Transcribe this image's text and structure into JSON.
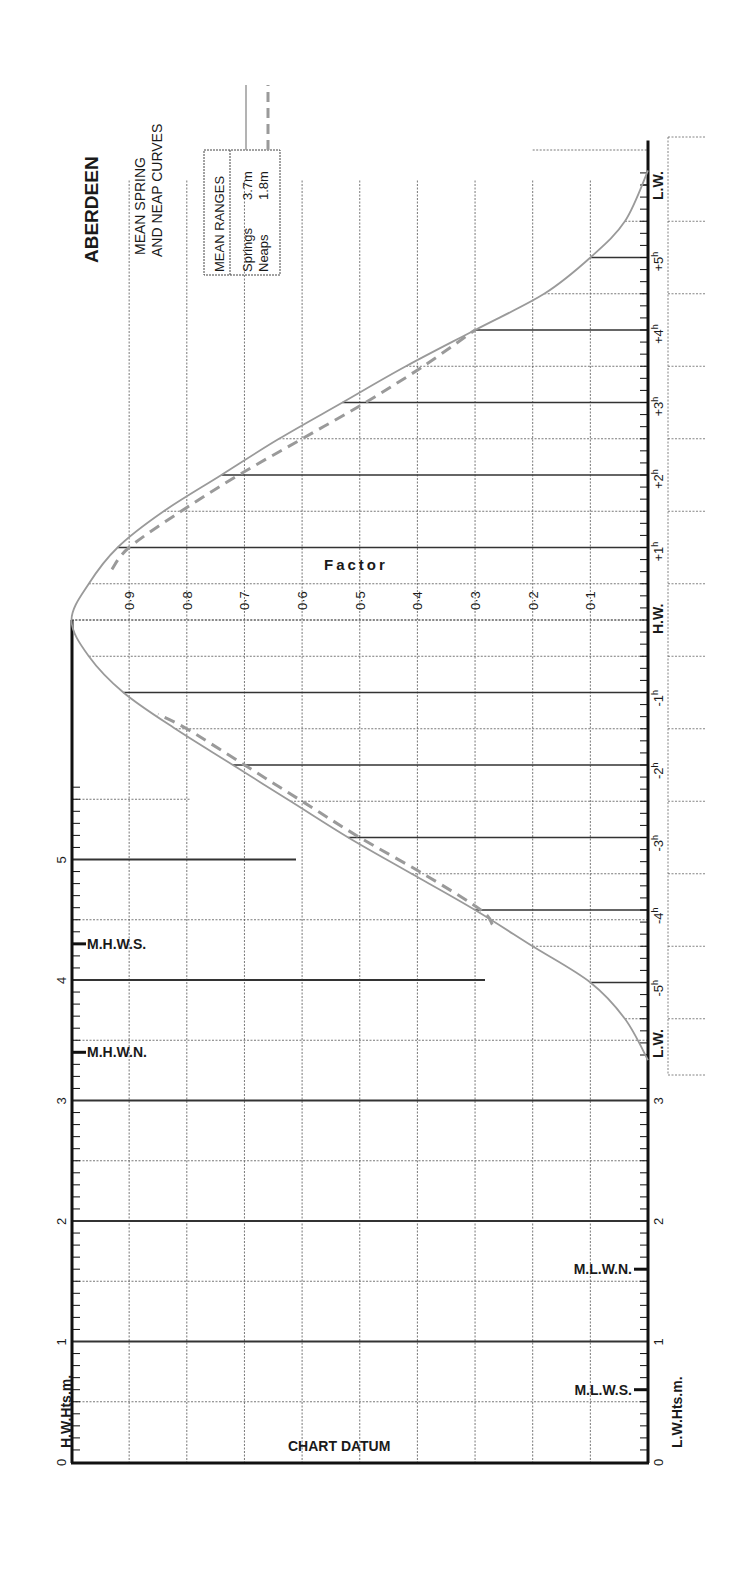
{
  "title": "ABERDEEN",
  "subtitle_lines": [
    "MEAN SPRING",
    "AND NEAP CURVES"
  ],
  "legend": {
    "header": "MEAN RANGES",
    "entries": [
      {
        "name": "Springs",
        "value": "3.7m",
        "style": "solid"
      },
      {
        "name": "Neaps",
        "value": "1.8m",
        "style": "dashed"
      }
    ]
  },
  "factor_axis_label": "Factor",
  "hw_axis_label": "H.W.Hts.m.",
  "lw_axis_label": "L.W.Hts.m.",
  "chart_datum_label": "CHART DATUM",
  "hw_markers": [
    {
      "label": "M.H.W.S.",
      "value": 4.3
    },
    {
      "label": "M.H.W.N.",
      "value": 3.4
    }
  ],
  "lw_markers": [
    {
      "label": "M.L.W.N.",
      "value": 1.6
    },
    {
      "label": "M.L.W.S.",
      "value": 0.6
    }
  ],
  "colors": {
    "axis": "#111111",
    "grid": "#555555",
    "curve": "#9a9a9a",
    "text": "#1a1a1a"
  },
  "chart_data": {
    "type": "line",
    "xlabel": "Time relative to H.W. (hours)",
    "ylabel": "Factor",
    "time_tick_labels": [
      "L.W.",
      "-5h",
      "-4h",
      "-3h",
      "-2h",
      "-1h",
      "H.W.",
      "+1h",
      "+2h",
      "+3h",
      "+4h",
      "+5h",
      "L.W."
    ],
    "time_ticks": [
      -6.07,
      -5,
      -4,
      -3,
      -2,
      -1,
      0,
      1,
      2,
      3,
      4,
      5,
      6.2
    ],
    "factor_ticks": [
      0.1,
      0.2,
      0.3,
      0.4,
      0.5,
      0.6,
      0.7,
      0.8,
      0.9
    ],
    "factor_tick_labels": [
      "0·1",
      "0·2",
      "0·3",
      "0·4",
      "0·5",
      "0·6",
      "0·7",
      "0·8",
      "0·9"
    ],
    "ylim": [
      0,
      1
    ],
    "hw_height_axis": {
      "label": "H.W.Hts.m.",
      "range": [
        0,
        5.7
      ],
      "ticks": [
        0,
        1,
        2,
        3,
        4,
        5
      ]
    },
    "lw_height_axis": {
      "label": "L.W.Hts.m.",
      "range": [
        0,
        3
      ],
      "ticks": [
        0,
        1,
        2,
        3
      ]
    },
    "series": [
      {
        "name": "Springs (3.7m)",
        "style": "solid",
        "x": [
          -6.07,
          -5.5,
          -5,
          -4.5,
          -4,
          -3.5,
          -3,
          -2.5,
          -2,
          -1.5,
          -1,
          -0.5,
          0,
          0.5,
          1,
          1.5,
          2,
          2.5,
          3,
          3.5,
          4,
          4.5,
          5,
          5.5,
          6.2
        ],
        "values": [
          0,
          0.04,
          0.1,
          0.2,
          0.3,
          0.41,
          0.52,
          0.62,
          0.72,
          0.82,
          0.91,
          0.97,
          1.0,
          0.97,
          0.92,
          0.84,
          0.74,
          0.64,
          0.53,
          0.42,
          0.3,
          0.18,
          0.1,
          0.04,
          0
        ]
      },
      {
        "name": "Neaps (1.8m) rising",
        "style": "dashed",
        "x": [
          -4.2,
          -4,
          -3.5,
          -3,
          -2.5,
          -2,
          -1.5,
          -1.3
        ],
        "values": [
          0.27,
          0.29,
          0.39,
          0.5,
          0.6,
          0.7,
          0.8,
          0.85
        ]
      },
      {
        "name": "Neaps (1.8m) falling",
        "style": "dashed",
        "x": [
          0.7,
          1,
          1.5,
          2,
          2.5,
          3,
          3.5,
          4
        ],
        "values": [
          0.93,
          0.9,
          0.81,
          0.71,
          0.6,
          0.49,
          0.39,
          0.3
        ]
      }
    ],
    "legend_position": "top-left"
  }
}
